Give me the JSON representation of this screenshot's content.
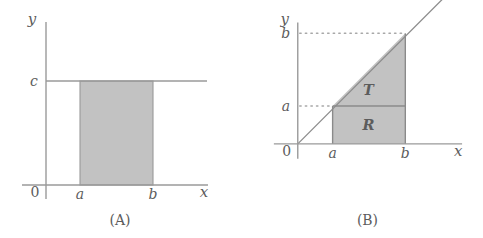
{
  "figure": {
    "background_color": "#ffffff",
    "ink_color": "#5c5c5c",
    "line_color": "#9a9a9a",
    "shade_color": "#c2c2c2",
    "panels": [
      {
        "id": "A",
        "caption": "(A)",
        "axes": {
          "x_label": "x",
          "y_label": "y",
          "origin_label": "0"
        },
        "ticks": {
          "x": [
            "a",
            "b"
          ],
          "y": [
            "c"
          ]
        },
        "shapes": [
          {
            "name": "rectangle",
            "label": "",
            "description": "shaded rectangle under the horizontal line y = c between x = a and x = b"
          },
          {
            "name": "constant-line",
            "label": "",
            "description": "horizontal line at height c"
          }
        ]
      },
      {
        "id": "B",
        "caption": "(B)",
        "axes": {
          "x_label": "x",
          "y_label": "y",
          "origin_label": "0"
        },
        "ticks": {
          "x": [
            "a",
            "b"
          ],
          "y": [
            "a",
            "b"
          ]
        },
        "shapes": [
          {
            "name": "triangle",
            "label": "T",
            "description": "shaded triangle between the line y = x and the horizontal level y = a, from x = a to x = b"
          },
          {
            "name": "rectangle",
            "label": "R",
            "description": "shaded rectangle of height a between x = a and x = b"
          },
          {
            "name": "identity-line",
            "label": "",
            "description": "diagonal line y = x through the origin"
          }
        ],
        "guides": [
          {
            "name": "dotted-guide-a",
            "label": "a",
            "style": "dotted"
          },
          {
            "name": "dotted-guide-b",
            "label": "b",
            "style": "dotted"
          }
        ]
      }
    ]
  }
}
